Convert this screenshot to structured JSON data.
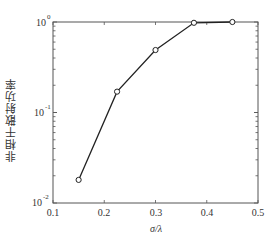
{
  "chart_data": {
    "type": "line",
    "title": "",
    "xlabel": "σ/λ",
    "ylabel": "非相干散射功率",
    "xscale": "linear",
    "yscale": "log",
    "xlim": [
      0.1,
      0.5
    ],
    "ylim": [
      0.01,
      1
    ],
    "xticks": [
      0.1,
      0.2,
      0.3,
      0.4,
      0.5
    ],
    "xtick_labels": [
      "0.1",
      "0.2",
      "0.3",
      "0.4",
      "0.5"
    ],
    "yticks": [
      0.01,
      0.1,
      1
    ],
    "ytick_labels": [
      "10^-2",
      "10^-1",
      "10^0"
    ],
    "grid": false,
    "legend": null,
    "series": [
      {
        "name": "incoherent scattering power",
        "marker": "open-circle",
        "color": "#222222",
        "x": [
          0.15,
          0.225,
          0.3,
          0.375,
          0.45
        ],
        "y": [
          0.018,
          0.17,
          0.49,
          0.98,
          1.0
        ]
      }
    ]
  },
  "labels": {
    "xlabel": "σ/λ",
    "ylabel": "非相干散射功率",
    "x0": "0.1",
    "x1": "0.2",
    "x2": "0.3",
    "x3": "0.4",
    "x4": "0.5",
    "ybase": "10",
    "yexp0": "-2",
    "yexp1": "-1",
    "yexp2": "0"
  }
}
